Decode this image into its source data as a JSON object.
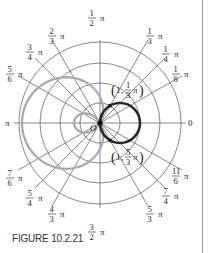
{
  "figure": {
    "caption": "FIGURE 10.2.21",
    "origin_label": "O",
    "zero_label": "0",
    "pi_label": "π",
    "angle_labels": [
      {
        "num": "1",
        "den": "6",
        "angle_deg": 30
      },
      {
        "num": "1",
        "den": "4",
        "angle_deg": 45
      },
      {
        "num": "1",
        "den": "3",
        "angle_deg": 60
      },
      {
        "num": "1",
        "den": "2",
        "angle_deg": 90
      },
      {
        "num": "2",
        "den": "3",
        "angle_deg": 120
      },
      {
        "num": "3",
        "den": "4",
        "angle_deg": 135
      },
      {
        "num": "5",
        "den": "6",
        "angle_deg": 150
      },
      {
        "num": "7",
        "den": "6",
        "angle_deg": 210
      },
      {
        "num": "5",
        "den": "4",
        "angle_deg": 225
      },
      {
        "num": "4",
        "den": "3",
        "angle_deg": 240
      },
      {
        "num": "3",
        "den": "2",
        "angle_deg": 270
      },
      {
        "num": "5",
        "den": "3",
        "angle_deg": 300
      },
      {
        "num": "7",
        "den": "4",
        "angle_deg": 315
      },
      {
        "num": "11",
        "den": "6",
        "angle_deg": 330
      }
    ],
    "points": [
      {
        "label_r": "1",
        "label_num": "1",
        "label_den": "3",
        "angle_deg": 60
      },
      {
        "label_r": "1",
        "label_num": "5",
        "label_den": "3",
        "angle_deg": 300
      }
    ],
    "colors": {
      "grid": "#555555",
      "gray_curve": "#a8a8a8",
      "bold_curve": "#2a2a2a",
      "rule": "#9a9a9a"
    }
  }
}
